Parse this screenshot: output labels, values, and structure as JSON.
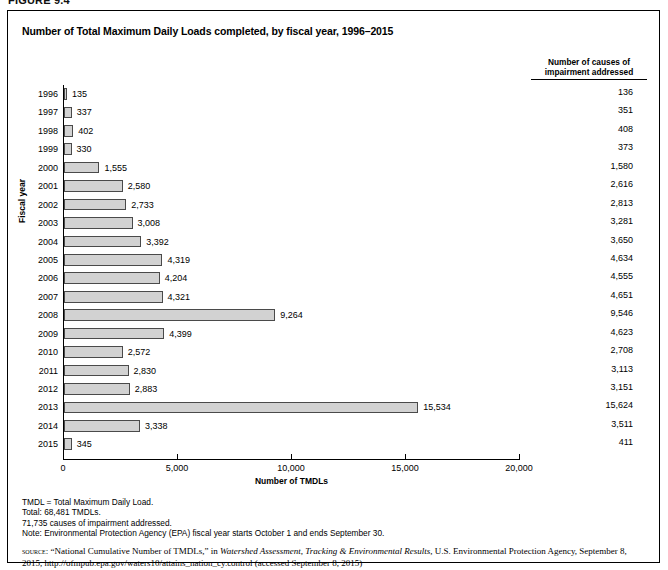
{
  "figure": {
    "label": "FIGURE 9.4",
    "title": "Number of Total Maximum Daily Loads completed, by fiscal year, 1996–2015"
  },
  "causes_column": {
    "header_line1": "Number of causes of",
    "header_line2": "impairment addressed"
  },
  "axes": {
    "y_label": "Fiscal year",
    "x_label": "Number of TMDLs",
    "x_ticks": [
      "0",
      "5,000",
      "10,000",
      "15,000",
      "20,000"
    ]
  },
  "notes": [
    "TMDL = Total Maximum Daily Load.",
    "Total: 68,481 TMDLs.",
    "71,735 causes of impairment addressed.",
    "Note: Environmental Protection Agency (EPA) fiscal year starts October 1 and ends September 30."
  ],
  "source": {
    "label": "source:",
    "part1": " “National Cumulative Number of TMDLs,” in ",
    "italic1": "Watershed Assessment, Tracking & Environmental Results",
    "part2": ", U.S. Environmental Protection Agency, September 8, 2015, http://ofmpub.epa.gov/waters10/attains_nation_cy.control (accessed September 8, 2015)"
  },
  "chart_data": {
    "type": "bar",
    "orientation": "horizontal",
    "title": "Number of Total Maximum Daily Loads completed, by fiscal year, 1996–2015",
    "xlabel": "Number of TMDLs",
    "ylabel": "Fiscal year",
    "xlim": [
      0,
      20000
    ],
    "grid": false,
    "legend": "none",
    "categories": [
      "1996",
      "1997",
      "1998",
      "1999",
      "2000",
      "2001",
      "2002",
      "2003",
      "2004",
      "2005",
      "2006",
      "2007",
      "2008",
      "2009",
      "2010",
      "2011",
      "2012",
      "2013",
      "2014",
      "2015"
    ],
    "values": [
      135,
      337,
      402,
      330,
      1555,
      2580,
      2733,
      3008,
      3392,
      4319,
      4204,
      4321,
      9264,
      4399,
      2572,
      2830,
      2883,
      15534,
      3338,
      345
    ],
    "value_labels": [
      "135",
      "337",
      "402",
      "330",
      "1,555",
      "2,580",
      "2,733",
      "3,008",
      "3,392",
      "4,319",
      "4,204",
      "4,321",
      "9,264",
      "4,399",
      "2,572",
      "2,830",
      "2,883",
      "15,534",
      "3,338",
      "345"
    ],
    "series": [
      {
        "name": "Number of causes of impairment addressed",
        "values": [
          136,
          351,
          408,
          373,
          1580,
          2616,
          2813,
          3281,
          3650,
          4634,
          4555,
          4651,
          9546,
          4623,
          2708,
          3113,
          3151,
          15624,
          3511,
          411
        ],
        "value_labels": [
          "136",
          "351",
          "408",
          "373",
          "1,580",
          "2,616",
          "2,813",
          "3,281",
          "3,650",
          "4,634",
          "4,555",
          "4,651",
          "9,546",
          "4,623",
          "2,708",
          "3,113",
          "3,151",
          "15,624",
          "3,511",
          "411"
        ],
        "render": "table-column"
      }
    ],
    "bar_fill": "#d2d2d2",
    "bar_border": "#4a4a4a"
  }
}
